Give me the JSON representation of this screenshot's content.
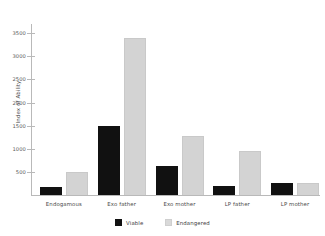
{
  "chart_data": {
    "type": "bar",
    "title": "",
    "xlabel": "",
    "ylabel": "Index of Ability",
    "categories": [
      "Endogamous",
      "Exo father",
      "Exo mother",
      "LP father",
      "LP mother"
    ],
    "series": [
      {
        "name": "Viable",
        "color": "#111111",
        "values": [
          180,
          1490,
          630,
          200,
          260
        ]
      },
      {
        "name": "Endangered",
        "color": "#d3d3d3",
        "values": [
          500,
          3400,
          1280,
          950,
          260
        ]
      }
    ],
    "ylim": [
      0,
      3700
    ],
    "yticks": [
      500,
      1000,
      1500,
      2000,
      2500,
      3000,
      3500
    ],
    "ytick_labels": [
      "500",
      "1000",
      "1500",
      "2000",
      "2500",
      "3000",
      "3500"
    ],
    "grid": false,
    "legend_position": "bottom-center"
  },
  "legend": {
    "entries": [
      {
        "label": "Viable"
      },
      {
        "label": "Endangered"
      }
    ]
  }
}
